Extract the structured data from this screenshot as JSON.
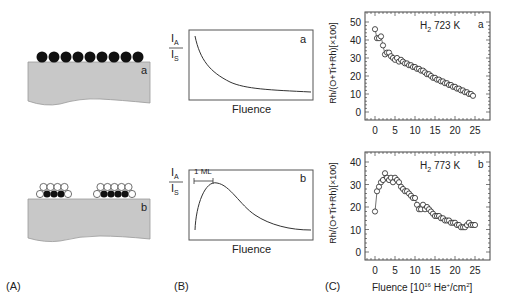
{
  "panels": {
    "A": {
      "label": "(A)",
      "top": {
        "tag": "a",
        "atoms_filled": 9
      },
      "bottom": {
        "tag": "b"
      }
    },
    "B": {
      "label": "(B)",
      "ylabel_num": "I",
      "ylabel_num_sub": "A",
      "ylabel_den": "I",
      "ylabel_den_sub": "S",
      "top": {
        "tag": "a",
        "xlabel": "Fluence"
      },
      "bottom": {
        "tag": "b",
        "xlabel": "Fluence",
        "marker": "1 ML"
      }
    },
    "C": {
      "label": "(C)",
      "xlabel": "Fluence [10",
      "xlabel_sup": "16",
      "xlabel_rest": " He",
      "xlabel_sup2": "+",
      "xlabel_end": "/cm",
      "xlabel_sup3": "2",
      "xlabel_close": "]",
      "ylabel": "Rh/(O+Ti+Rh)[×100]",
      "top": {
        "tag": "a",
        "legend": "H",
        "legend_sub": "2",
        "legend_rest": " 723 K"
      },
      "bottom": {
        "tag": "b",
        "legend": "H",
        "legend_sub": "2",
        "legend_rest": " 773 K"
      }
    }
  },
  "chart_data": [
    {
      "type": "line",
      "title": "(B) a",
      "xlabel": "Fluence",
      "ylabel": "I_A / I_S",
      "description": "Monotonic decay from high initial value to a plateau",
      "x": [
        0,
        0.1,
        0.2,
        0.3,
        0.4,
        0.5,
        0.6,
        0.8,
        1.0
      ],
      "values": [
        1.0,
        0.55,
        0.35,
        0.22,
        0.15,
        0.13,
        0.12,
        0.11,
        0.1
      ]
    },
    {
      "type": "line",
      "title": "(B) b",
      "xlabel": "Fluence",
      "ylabel": "I_A / I_S",
      "annotations": [
        "1 ML"
      ],
      "description": "Rise to maximum near 1 ML then decay",
      "x": [
        0,
        0.05,
        0.1,
        0.15,
        0.2,
        0.3,
        0.4,
        0.5,
        0.6,
        0.8,
        1.0
      ],
      "values": [
        0.1,
        0.7,
        0.9,
        0.98,
        1.0,
        0.85,
        0.6,
        0.4,
        0.28,
        0.15,
        0.12
      ]
    },
    {
      "type": "scatter",
      "title": "H2 723 K",
      "tag": "a",
      "xlabel": "Fluence [10^16 He+/cm2]",
      "ylabel": "Rh/(O+Ti+Rh)[×100]",
      "xlim": [
        -2,
        27
      ],
      "ylim": [
        -5,
        55
      ],
      "xticks": [
        0,
        5,
        10,
        15,
        20,
        25
      ],
      "yticks": [
        0,
        10,
        20,
        30,
        40,
        50
      ],
      "x": [
        0,
        0.5,
        1,
        1.5,
        2,
        2.5,
        3,
        3.5,
        4,
        4.5,
        5,
        5.5,
        6,
        6.5,
        7,
        7.5,
        8,
        8.5,
        9,
        9.5,
        10,
        10.5,
        11,
        11.5,
        12,
        12.5,
        13,
        13.5,
        14,
        14.5,
        15,
        15.5,
        16,
        16.5,
        17,
        17.5,
        18,
        18.5,
        19,
        19.5,
        20,
        20.5,
        21,
        21.5,
        22,
        22.5,
        23,
        23.5,
        24,
        24.5
      ],
      "values": [
        46,
        41,
        41,
        42,
        37,
        32,
        33,
        33,
        31,
        30,
        29,
        30,
        28,
        29,
        28,
        27,
        27,
        26,
        26,
        25,
        25,
        24,
        24,
        23,
        23,
        22,
        21,
        21,
        20,
        19,
        19,
        18,
        18,
        17,
        17,
        16,
        16,
        15,
        15,
        14,
        14,
        13,
        13,
        12,
        12,
        11,
        11,
        10,
        10,
        9
      ]
    },
    {
      "type": "scatter",
      "title": "H2 773 K",
      "tag": "b",
      "xlabel": "Fluence [10^16 He+/cm2]",
      "ylabel": "Rh/(O+Ti+Rh)[×100]",
      "xlim": [
        -2,
        27
      ],
      "ylim": [
        -5,
        45
      ],
      "xticks": [
        0,
        5,
        10,
        15,
        20,
        25
      ],
      "yticks": [
        0,
        10,
        20,
        30,
        40
      ],
      "x": [
        0,
        0.5,
        1,
        1.5,
        2,
        2.5,
        3,
        3.5,
        4,
        4.5,
        5,
        5.5,
        6,
        6.5,
        7,
        7.5,
        8,
        8.5,
        9,
        9.5,
        10,
        10.5,
        11,
        11.5,
        12,
        12.5,
        13,
        13.5,
        14,
        14.5,
        15,
        15.5,
        16,
        16.5,
        17,
        17.5,
        18,
        18.5,
        19,
        19.5,
        20,
        20.5,
        21,
        21.5,
        22,
        22.5,
        23,
        23.5,
        24,
        24.5,
        25
      ],
      "values": [
        18,
        27,
        29,
        31,
        32,
        35,
        33,
        32,
        33,
        31,
        33,
        32,
        31,
        29,
        28,
        27,
        27,
        26,
        25,
        24,
        24,
        21,
        19,
        19,
        21,
        19,
        20,
        19,
        18,
        17,
        16,
        16,
        16,
        15,
        15,
        14,
        14,
        14,
        13,
        13,
        13,
        12,
        12,
        11,
        11,
        11,
        12,
        13,
        12,
        12,
        12
      ]
    }
  ]
}
